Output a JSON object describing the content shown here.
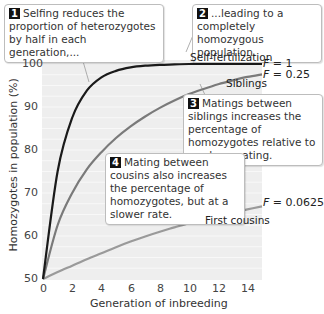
{
  "chart_data": {
    "type": "line",
    "title": "",
    "xlabel": "Generation of inbreeding",
    "ylabel": "Homozygotes in population (%)",
    "xlim": [
      0,
      15
    ],
    "ylim": [
      50,
      100
    ],
    "xticks": [
      0,
      2,
      4,
      6,
      8,
      10,
      12,
      14
    ],
    "yticks": [
      50,
      60,
      70,
      80,
      90,
      100
    ],
    "grid": true,
    "x": [
      0,
      1,
      2,
      3,
      4,
      5,
      6,
      7,
      8,
      9,
      10,
      11,
      12,
      13,
      14,
      15
    ],
    "series": [
      {
        "name": "Self-fertilization",
        "F_label": "F = 1",
        "color": "#1a1a1a",
        "values": [
          50,
          75,
          87.5,
          93.8,
          96.9,
          98.4,
          99.2,
          99.6,
          99.8,
          99.9,
          100,
          100,
          100,
          100,
          100,
          100
        ]
      },
      {
        "name": "Siblings",
        "F_label": "F = 0.25",
        "color": "#7a7a7a",
        "values": [
          50,
          62.5,
          70,
          75.5,
          79.5,
          82.8,
          85.5,
          87.8,
          89.8,
          91.5,
          93,
          94.2,
          95.3,
          96.2,
          97,
          97.6
        ]
      },
      {
        "name": "First cousins",
        "F_label": "F = 0.0625",
        "color": "#9a9a9a",
        "values": [
          50,
          51.6,
          53.1,
          54.6,
          56,
          57.4,
          58.7,
          59.9,
          61,
          62,
          63,
          63.9,
          64.7,
          65.5,
          66.2,
          66.9
        ]
      }
    ],
    "annotations": [
      {
        "id": 1,
        "text": "Selfing reduces the proportion of heterozygotes by half in each generation,..."
      },
      {
        "id": 2,
        "text": "...leading to a completely homozygous population."
      },
      {
        "id": 3,
        "text": "Matings between siblings increases the percentage of homozygotes relative to random mating."
      },
      {
        "id": 4,
        "text": "Mating between cousins also increases the percentage of homozygotes, but at a slower rate."
      }
    ]
  },
  "labels": {
    "self": "Self-fertilization",
    "sib": "Siblings",
    "cousin": "First cousins",
    "F_self_pre": "F",
    "F_self_val": " = 1",
    "F_sib_pre": "F",
    "F_sib_val": " = 0.25",
    "F_cousin_pre": "F",
    "F_cousin_val": " = 0.0625"
  },
  "callouts": {
    "c1_num": "1",
    "c1_text": "Selfing reduces the proportion of heterozygotes by half in each generation,...",
    "c2_num": "2",
    "c2_text": "...leading to a completely homozygous population.",
    "c3_num": "3",
    "c3_text": "Matings between siblings increases the percentage of homozygotes relative to random mating.",
    "c4_num": "4",
    "c4_text": "Mating between cousins also increases the percentage of homozygotes, but at a slower rate."
  },
  "axes": {
    "xlabel": "Generation of inbreeding",
    "ylabel": "Homozygotes in population (%)",
    "yticks": [
      "100",
      "90",
      "80",
      "70",
      "60",
      "50"
    ],
    "xticks": [
      "0",
      "2",
      "4",
      "6",
      "8",
      "10",
      "12",
      "14"
    ]
  }
}
